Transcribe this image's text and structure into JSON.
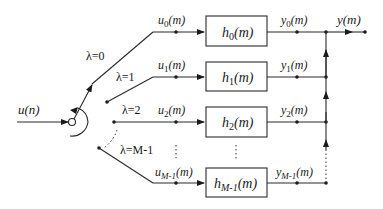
{
  "diagram": {
    "input": {
      "label": "u(n)"
    },
    "output": {
      "label": "y(m)"
    },
    "branches": [
      {
        "lambda": "λ=0",
        "u": "u",
        "u_sub": "0",
        "u_arg": "(m)",
        "h": "h",
        "h_sub": "0",
        "h_arg": "(m)",
        "y": "y",
        "y_sub": "0",
        "y_arg": "(m)"
      },
      {
        "lambda": "λ=1",
        "u": "u",
        "u_sub": "1",
        "u_arg": "(m)",
        "h": "h",
        "h_sub": "1",
        "h_arg": "(m)",
        "y": "y",
        "y_sub": "1",
        "y_arg": "(m)"
      },
      {
        "lambda": "λ=2",
        "u": "u",
        "u_sub": "2",
        "u_arg": "(m)",
        "h": "h",
        "h_sub": "2",
        "h_arg": "(m)",
        "y": "y",
        "y_sub": "2",
        "y_arg": "(m)"
      },
      {
        "lambda": "λ=M-1",
        "u": "u",
        "u_sub": "M-1",
        "u_arg": "(m)",
        "h": "h",
        "h_sub": "M-1",
        "h_arg": "(m)",
        "y": "y",
        "y_sub": "M-1",
        "y_arg": "(m)"
      }
    ],
    "ellipsis": "⋮",
    "icons": [
      "commutator-switch-icon",
      "rotation-arrow-icon",
      "arrowhead-icon",
      "junction-dot-icon"
    ],
    "colors": {
      "line": "#2a2a2a",
      "background": "#ffffff"
    }
  }
}
